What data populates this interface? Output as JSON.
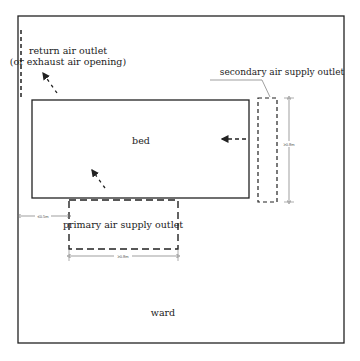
{
  "diagram": {
    "room_label": "ward",
    "bed_label": "bed",
    "return_outlet": {
      "line1": "return air outlet",
      "line2": "(or exhaust air opening)"
    },
    "secondary_outlet_label": "secondary air supply outlet",
    "primary_outlet_label": "primary air supply outlet",
    "dimensions": {
      "secondary_height": "≥0.8m",
      "primary_width": "≥0.8m",
      "primary_offset": "≤0.5m"
    },
    "colors": {
      "line": "#222222",
      "dim_line": "#777777",
      "background": "#ffffff"
    }
  }
}
